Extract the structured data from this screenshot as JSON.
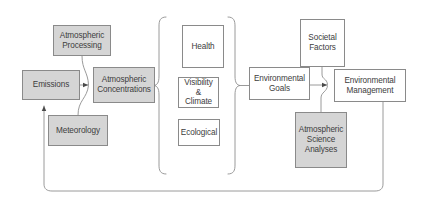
{
  "diagram": {
    "colors": {
      "shaded_fill": "#d5d5d5",
      "plain_fill": "#ffffff",
      "stroke": "#8a8a8a",
      "text": "#3d3d3d",
      "background": "#ffffff"
    },
    "nodes": [
      {
        "id": "emissions",
        "label": "Emissions",
        "style": "shaded",
        "x": 22,
        "y": 70,
        "w": 58,
        "h": 30,
        "font_size": 8.2
      },
      {
        "id": "atmospheric-processing",
        "label": "Atmospheric\nProcessing",
        "style": "shaded",
        "x": 53,
        "y": 25,
        "w": 58,
        "h": 31,
        "font_size": 8.2
      },
      {
        "id": "meteorology",
        "label": "Meteorology",
        "style": "shaded",
        "x": 48,
        "y": 115,
        "w": 60,
        "h": 31,
        "font_size": 8.2
      },
      {
        "id": "atmospheric-concentrations",
        "label": "Atmospheric\nConcentrations",
        "style": "shaded",
        "x": 93,
        "y": 67,
        "w": 62,
        "h": 36,
        "font_size": 8.2
      },
      {
        "id": "health",
        "label": "Health",
        "style": "plain",
        "x": 182,
        "y": 25,
        "w": 42,
        "h": 43,
        "font_size": 8.2
      },
      {
        "id": "visibility-climate",
        "label": "Visibility\n&\nClimate",
        "style": "plain",
        "x": 178,
        "y": 77,
        "w": 41,
        "h": 31,
        "font_size": 8.2
      },
      {
        "id": "ecological",
        "label": "Ecological",
        "style": "plain",
        "x": 178,
        "y": 119,
        "w": 42,
        "h": 27,
        "font_size": 8.2
      },
      {
        "id": "environmental-goals",
        "label": "Environmental\nGoals",
        "style": "plain",
        "x": 249,
        "y": 67,
        "w": 61,
        "h": 33,
        "font_size": 8.2
      },
      {
        "id": "societal-factors",
        "label": "Societal\nFactors",
        "style": "plain",
        "x": 300,
        "y": 19,
        "w": 45,
        "h": 48,
        "font_size": 8.2
      },
      {
        "id": "environmental-management",
        "label": "Environmental\nManagement",
        "style": "plain",
        "x": 334,
        "y": 69,
        "w": 72,
        "h": 33,
        "font_size": 8.2
      },
      {
        "id": "atmospheric-science-analyses",
        "label": "Atmospheric\nScience\nAnalyses",
        "style": "shaded",
        "x": 295,
        "y": 112,
        "w": 52,
        "h": 56,
        "font_size": 8.2
      }
    ],
    "connections": [
      {
        "id": "emissions-to-concentrations",
        "from": "emissions",
        "to": "atmospheric-concentrations",
        "arrow": true
      },
      {
        "id": "processing-to-concentrations",
        "from": "atmospheric-processing",
        "to": "atmospheric-concentrations",
        "arrow": false
      },
      {
        "id": "meteorology-to-concentrations",
        "from": "meteorology",
        "to": "atmospheric-concentrations",
        "arrow": false
      },
      {
        "id": "concentrations-to-effects-brace",
        "from": "atmospheric-concentrations",
        "to": "effects-group",
        "arrow": false
      },
      {
        "id": "effects-to-goals-brace",
        "from": "effects-group",
        "to": "environmental-goals",
        "arrow": false
      },
      {
        "id": "goals-to-management",
        "from": "environmental-goals",
        "to": "environmental-management",
        "arrow": true
      },
      {
        "id": "societal-factors-to-management",
        "from": "societal-factors",
        "to": "environmental-management",
        "arrow": false
      },
      {
        "id": "science-analyses-to-management",
        "from": "atmospheric-science-analyses",
        "to": "environmental-management",
        "arrow": false
      },
      {
        "id": "management-feedback-to-emissions",
        "from": "environmental-management",
        "to": "emissions",
        "arrow": true
      }
    ],
    "groups": [
      {
        "id": "effects-group",
        "label": "",
        "members": [
          "health",
          "visibility-climate",
          "ecological"
        ]
      }
    ]
  }
}
